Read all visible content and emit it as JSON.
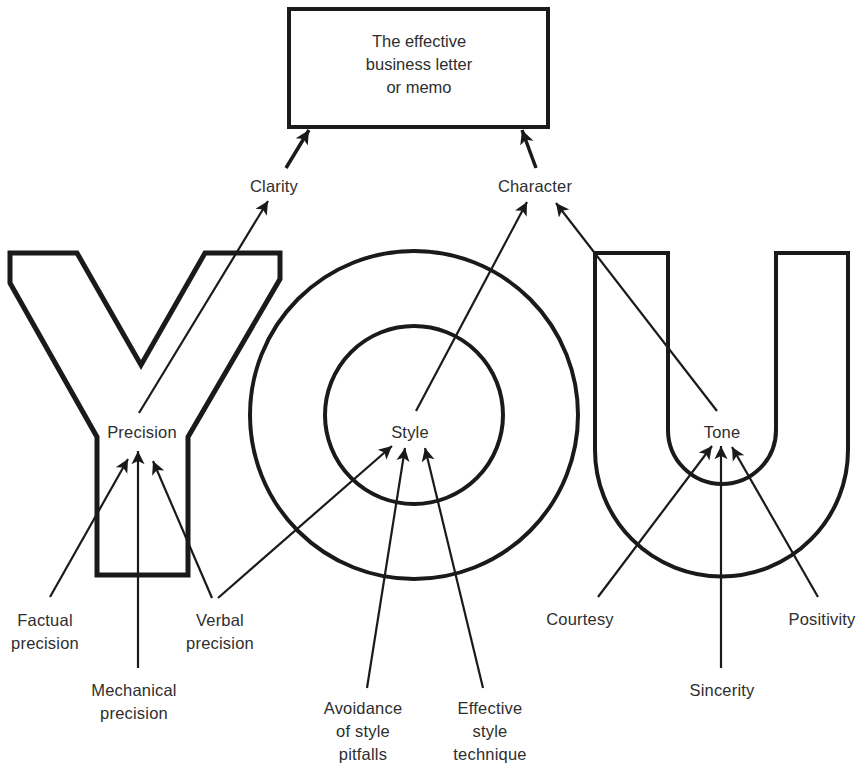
{
  "title_box": {
    "text": "The effective\nbusiness letter\nor memo"
  },
  "qualities": {
    "clarity": "Clarity",
    "character": "Character"
  },
  "letters": [
    "Y",
    "O",
    "U"
  ],
  "hubs": {
    "precision": "Precision",
    "style": "Style",
    "tone": "Tone"
  },
  "sources": {
    "factual_precision": "Factual\nprecision",
    "mechanical_precision": "Mechanical\nprecision",
    "verbal_precision": "Verbal\nprecision",
    "avoidance_of_style_pitfalls": "Avoidance\nof style\npitfalls",
    "effective_style_technique": "Effective\nstyle\ntechnique",
    "courtesy": "Courtesy",
    "sincerity": "Sincerity",
    "positivity": "Positivity"
  },
  "relations": [
    {
      "from": "Clarity",
      "to": "The effective business letter or memo"
    },
    {
      "from": "Character",
      "to": "The effective business letter or memo"
    },
    {
      "from": "Precision",
      "to": "Clarity"
    },
    {
      "from": "Style",
      "to": "Character"
    },
    {
      "from": "Tone",
      "to": "Character"
    },
    {
      "from": "Factual precision",
      "to": "Precision"
    },
    {
      "from": "Mechanical precision",
      "to": "Precision"
    },
    {
      "from": "Verbal precision",
      "to": "Precision"
    },
    {
      "from": "Verbal precision",
      "to": "Style"
    },
    {
      "from": "Avoidance of style pitfalls",
      "to": "Style"
    },
    {
      "from": "Effective style technique",
      "to": "Style"
    },
    {
      "from": "Courtesy",
      "to": "Tone"
    },
    {
      "from": "Sincerity",
      "to": "Tone"
    },
    {
      "from": "Positivity",
      "to": "Tone"
    }
  ],
  "colors": {
    "ink": "#1a1a1a",
    "text": "#2e2e2e",
    "background": "#ffffff"
  }
}
